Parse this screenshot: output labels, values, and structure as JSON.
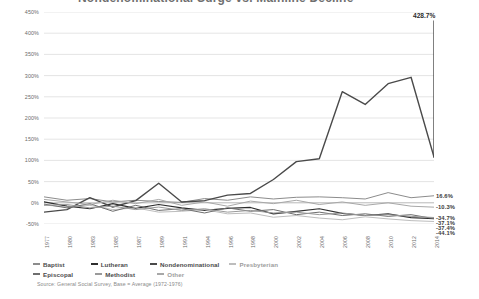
{
  "title": {
    "text": "Nondenominational Surge vs. Mainline Decline"
  },
  "peak_callout": {
    "value": "428.7%"
  },
  "source": {
    "text": "Source: General Social Survey, Base = Average (1972-1976)"
  },
  "legend": {
    "row1": [
      {
        "label": "Baptist",
        "color": "#8c8c8c"
      },
      {
        "label": "Lutheran",
        "color": "#2e2e2e"
      },
      {
        "label": "Nondenominational",
        "color": "#4a4a4a"
      },
      {
        "label": "Presbyterian",
        "color": "#bdbdbd"
      }
    ],
    "row2": [
      {
        "label": "Episcopal",
        "color": "#6e6e6e"
      },
      {
        "label": "Methodist",
        "color": "#9a9a9a"
      },
      {
        "label": "Other",
        "color": "#a8a8a8"
      }
    ]
  },
  "chart_data": {
    "type": "line",
    "title": "Nondenominational Surge vs. Mainline Decline",
    "xlabel": "",
    "ylabel": "",
    "ylim": [
      -50,
      450
    ],
    "ytick_step": 50,
    "grid": true,
    "legend_position": "bottom-left",
    "ytick_labels": [
      "450%",
      "400%",
      "350%",
      "300%",
      "250%",
      "200%",
      "150%",
      "100%",
      "50%",
      "0%",
      "-50%"
    ],
    "ytick_values": [
      450,
      400,
      350,
      300,
      250,
      200,
      150,
      100,
      50,
      0,
      -50
    ],
    "categories": [
      "1977",
      "1980",
      "1983",
      "1985",
      "1987",
      "1989",
      "1991",
      "1994",
      "1996",
      "1998",
      "2000",
      "2002",
      "2004",
      "2006",
      "2008",
      "2010",
      "2012",
      "2014"
    ],
    "series": [
      {
        "name": "Baptist",
        "color": "#8c8c8c",
        "width": 1.0,
        "end_value_label": "16.6%",
        "values": [
          14.0,
          6.0,
          10.0,
          2.0,
          6.0,
          3.0,
          1.0,
          10.0,
          6.0,
          14.0,
          9.0,
          13.0,
          14.0,
          12.0,
          9.0,
          24.0,
          12.0,
          16.6
        ]
      },
      {
        "name": "Lutheran",
        "color": "#2e2e2e",
        "width": 1.2,
        "end_value_label": "-37.1%",
        "values": [
          2.0,
          -8.0,
          -14.0,
          -2.0,
          -13.0,
          -4.0,
          -12.0,
          -18.0,
          -13.0,
          -11.0,
          -26.0,
          -20.0,
          -14.0,
          -25.0,
          -30.0,
          -26.0,
          -35.0,
          -37.1
        ]
      },
      {
        "name": "Nondenominational",
        "color": "#4a4a4a",
        "width": 1.4,
        "end_value_label": "428.7%",
        "values": [
          -22.0,
          -16.0,
          12.0,
          -10.0,
          5.0,
          46.0,
          2.0,
          5.0,
          18.0,
          22.0,
          55.0,
          97.0,
          104.0,
          262.0,
          232.0,
          281.0,
          296.0,
          108.0
        ]
      },
      {
        "name": "Presbyterian",
        "color": "#bdbdbd",
        "width": 1.0,
        "end_value_label": "-44.1%",
        "values": [
          -5.0,
          -10.0,
          -6.0,
          -16.0,
          -12.0,
          -22.0,
          -20.0,
          -16.0,
          -26.0,
          -24.0,
          -34.0,
          -30.0,
          -36.0,
          -40.0,
          -33.0,
          -38.0,
          -42.0,
          -44.1
        ]
      },
      {
        "name": "Episcopal",
        "color": "#6e6e6e",
        "width": 1.0,
        "end_value_label": "-37.4%",
        "values": [
          -3.0,
          -12.0,
          -2.0,
          -20.0,
          -6.0,
          -18.0,
          -14.0,
          -24.0,
          -12.0,
          -20.0,
          -16.0,
          -28.0,
          -22.0,
          -30.0,
          -26.0,
          -32.0,
          -28.0,
          -37.4
        ]
      },
      {
        "name": "Methodist",
        "color": "#9a9a9a",
        "width": 1.0,
        "end_value_label": "-34.7%",
        "values": [
          -6.0,
          -4.0,
          -12.0,
          -8.0,
          -16.0,
          -10.0,
          -18.0,
          -14.0,
          -22.0,
          -18.0,
          -24.0,
          -22.0,
          -28.0,
          -24.0,
          -30.0,
          -28.0,
          -32.0,
          -34.7
        ]
      },
      {
        "name": "Other",
        "color": "#a8a8a8",
        "width": 1.0,
        "end_value_label": "-10.3%",
        "values": [
          8.0,
          2.0,
          -4.0,
          6.0,
          -2.0,
          8.0,
          -6.0,
          2.0,
          -8.0,
          4.0,
          -2.0,
          6.0,
          -4.0,
          2.0,
          -6.0,
          0.0,
          -8.0,
          -10.3
        ]
      }
    ],
    "annotations": [
      {
        "text": "428.7%",
        "series": "Nondenominational",
        "note": "peak at 2014 endpoint"
      }
    ]
  }
}
